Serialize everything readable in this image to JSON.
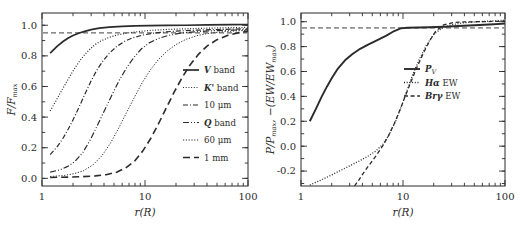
{
  "figure": {
    "background": "#ffffff",
    "ink": "#2b2b2b",
    "panels": [
      "left-panel",
      "right-panel"
    ]
  },
  "chart_data": [
    {
      "id": "left-panel",
      "type": "line",
      "title": "",
      "xlabel": "r(R)",
      "ylabel": "F/F_max",
      "ylabel_parts": {
        "main": "F/F",
        "sub": "max"
      },
      "xscale": "log",
      "xlim": [
        1,
        100
      ],
      "ylim": [
        -0.05,
        1.08
      ],
      "xticks": [
        1,
        10,
        100
      ],
      "xticklabels": [
        "1",
        "10",
        "100"
      ],
      "yticks": [
        0.0,
        0.2,
        0.4,
        0.6,
        0.8,
        1.0
      ],
      "yticklabels": [
        "0.0",
        "0.2",
        "0.4",
        "0.6",
        "0.8",
        "1.0"
      ],
      "grid": false,
      "legend_position": "center-right",
      "reference_line": {
        "y": 0.95,
        "style": "dashed",
        "label": "0.95 level"
      },
      "series": [
        {
          "name": "V band",
          "label_parts": {
            "italic": "V",
            "rest": " band"
          },
          "style": "solid",
          "width": 1.7,
          "x": [
            1.2,
            1.4,
            1.6,
            1.8,
            2.0,
            2.3,
            2.6,
            3.0,
            3.6,
            4.5,
            6.0,
            8.0,
            11.0,
            16.0,
            25.0,
            40.0,
            70.0,
            100.0
          ],
          "y": [
            0.818,
            0.862,
            0.894,
            0.917,
            0.933,
            0.949,
            0.96,
            0.971,
            0.981,
            0.988,
            0.993,
            0.996,
            0.998,
            0.999,
            1.0,
            1.002,
            1.004,
            1.005
          ]
        },
        {
          "name": "K' band",
          "label_parts": {
            "italic": "K'",
            "rest": " band"
          },
          "style": "dotted",
          "width": 1.2,
          "x": [
            1.2,
            1.35,
            1.5,
            1.7,
            1.9,
            2.1,
            2.35,
            2.6,
            2.9,
            3.3,
            3.8,
            4.5,
            5.5,
            7.0,
            9.0,
            12.0,
            17.0,
            25.0,
            40.0,
            65.0,
            100.0
          ],
          "y": [
            0.44,
            0.5,
            0.556,
            0.62,
            0.676,
            0.724,
            0.772,
            0.808,
            0.842,
            0.875,
            0.9,
            0.921,
            0.938,
            0.951,
            0.96,
            0.968,
            0.973,
            0.977,
            0.981,
            0.984,
            0.986
          ]
        },
        {
          "name": "10 μm",
          "label_parts": {
            "italic": "",
            "rest": "10 μm"
          },
          "style": "dash-dot",
          "width": 1.2,
          "x": [
            1.2,
            1.4,
            1.6,
            1.8,
            2.0,
            2.3,
            2.6,
            3.0,
            3.4,
            3.9,
            4.5,
            5.3,
            6.3,
            7.6,
            9.5,
            12.0,
            16.0,
            22.0,
            32.0,
            50.0,
            75.0,
            100.0
          ],
          "y": [
            0.155,
            0.205,
            0.262,
            0.322,
            0.382,
            0.468,
            0.548,
            0.637,
            0.706,
            0.766,
            0.817,
            0.861,
            0.894,
            0.918,
            0.936,
            0.948,
            0.957,
            0.963,
            0.968,
            0.972,
            0.975,
            0.977
          ]
        },
        {
          "name": "Q band",
          "label_parts": {
            "italic": "Q",
            "rest": " band"
          },
          "style": "dash-dot-dot",
          "width": 1.2,
          "x": [
            1.2,
            1.5,
            1.8,
            2.1,
            2.5,
            3.0,
            3.5,
            4.1,
            4.8,
            5.6,
            6.6,
            7.8,
            9.2,
            11.0,
            13.5,
            17.0,
            22.0,
            30.0,
            45.0,
            70.0,
            100.0
          ],
          "y": [
            0.041,
            0.056,
            0.08,
            0.112,
            0.17,
            0.262,
            0.355,
            0.452,
            0.548,
            0.638,
            0.72,
            0.79,
            0.845,
            0.885,
            0.914,
            0.934,
            0.948,
            0.957,
            0.964,
            0.968,
            0.971
          ]
        },
        {
          "name": "60 μm",
          "label_parts": {
            "italic": "",
            "rest": "60 μm"
          },
          "style": "thin-long-dash",
          "width": 1.0,
          "x": [
            1.2,
            1.6,
            2.0,
            2.5,
            3.1,
            3.8,
            4.6,
            5.5,
            6.6,
            7.9,
            9.4,
            11.2,
            13.5,
            16.5,
            20.0,
            25.0,
            32.0,
            42.0,
            58.0,
            80.0,
            100.0
          ],
          "y": [
            0.012,
            0.018,
            0.029,
            0.048,
            0.086,
            0.146,
            0.228,
            0.322,
            0.428,
            0.53,
            0.625,
            0.706,
            0.776,
            0.833,
            0.874,
            0.908,
            0.932,
            0.948,
            0.958,
            0.964,
            0.966
          ]
        },
        {
          "name": "1 mm",
          "label_parts": {
            "italic": "",
            "rest": "1 mm"
          },
          "style": "long-dash",
          "width": 1.6,
          "x": [
            1.2,
            1.8,
            2.5,
            3.3,
            4.2,
            5.3,
            6.5,
            7.9,
            9.5,
            11.4,
            13.6,
            16.2,
            19.3,
            23.0,
            27.5,
            33.0,
            40.0,
            50.0,
            64.0,
            82.0,
            100.0
          ],
          "y": [
            0.006,
            0.008,
            0.011,
            0.016,
            0.024,
            0.04,
            0.068,
            0.112,
            0.178,
            0.262,
            0.36,
            0.464,
            0.566,
            0.66,
            0.742,
            0.81,
            0.864,
            0.906,
            0.935,
            0.952,
            0.96
          ]
        }
      ]
    },
    {
      "id": "right-panel",
      "type": "line",
      "title": "",
      "xlabel": "r(R)",
      "ylabel": "P/P_max, -(EW/EW_max)",
      "ylabel_parts": {
        "p_main": "P/P",
        "p_sub": "max",
        "sep": ",  ",
        "ew_main": "−(EW/EW",
        "ew_sub": "max",
        "ew_close": ")"
      },
      "xscale": "log",
      "xlim": [
        1,
        100
      ],
      "ylim": [
        -0.32,
        1.07
      ],
      "xticks": [
        1,
        10,
        100
      ],
      "xticklabels": [
        "1",
        "10",
        "100"
      ],
      "yticks": [
        -0.2,
        0.0,
        0.2,
        0.4,
        0.6,
        0.8,
        1.0
      ],
      "yticklabels": [
        "-0.2",
        "0.0",
        "0.2",
        "0.4",
        "0.6",
        "0.8",
        "1.0"
      ],
      "grid": false,
      "legend_position": "center-right",
      "reference_line": {
        "y": 0.95,
        "style": "dashed",
        "label": "0.95 level"
      },
      "series": [
        {
          "name": "P_V",
          "label_parts": {
            "italic": "P",
            "sub": "V",
            "rest": ""
          },
          "style": "solid",
          "width": 1.9,
          "x": [
            1.22,
            1.4,
            1.6,
            1.8,
            2.0,
            2.3,
            2.7,
            3.2,
            3.8,
            4.6,
            5.6,
            6.8,
            8.2,
            9.5,
            11.0,
            14.0,
            18.0,
            25.0,
            35.0,
            50.0,
            70.0,
            100.0
          ],
          "y": [
            0.2,
            0.3,
            0.4,
            0.48,
            0.545,
            0.624,
            0.69,
            0.74,
            0.782,
            0.818,
            0.852,
            0.886,
            0.925,
            0.946,
            0.952,
            0.953,
            0.955,
            0.96,
            0.966,
            0.972,
            0.978,
            0.985
          ]
        },
        {
          "name": "Ha EW",
          "label_parts": {
            "italic": "Hα",
            "rest": " EW"
          },
          "style": "dotted",
          "width": 1.3,
          "x": [
            1.22,
            1.5,
            1.9,
            2.4,
            3.0,
            3.7,
            4.5,
            5.4,
            6.4,
            7.4,
            8.5,
            9.7,
            11.0,
            12.5,
            14.5,
            17.0,
            20.0,
            24.0,
            30.0,
            40.0,
            55.0,
            75.0,
            100.0
          ],
          "y": [
            -0.312,
            -0.28,
            -0.24,
            -0.198,
            -0.158,
            -0.12,
            -0.082,
            -0.04,
            0.018,
            0.1,
            0.205,
            0.325,
            0.452,
            0.578,
            0.7,
            0.812,
            0.898,
            0.948,
            0.976,
            0.992,
            1.0,
            1.006,
            1.012
          ]
        },
        {
          "name": "Bry EW",
          "label_parts": {
            "italic": "Brγ",
            "rest": " EW"
          },
          "style": "dashed2",
          "width": 1.3,
          "x": [
            3.35,
            3.7,
            4.2,
            4.8,
            5.5,
            6.3,
            7.2,
            8.2,
            9.3,
            10.5,
            12.0,
            13.8,
            16.0,
            18.5,
            21.0,
            25.0,
            31.0,
            40.0,
            55.0,
            75.0,
            100.0
          ],
          "y": [
            -0.32,
            -0.27,
            -0.202,
            -0.138,
            -0.072,
            0.0,
            0.084,
            0.18,
            0.288,
            0.4,
            0.52,
            0.64,
            0.755,
            0.855,
            0.925,
            0.975,
            0.993,
            0.998,
            1.0,
            1.002,
            1.004
          ]
        }
      ]
    }
  ]
}
